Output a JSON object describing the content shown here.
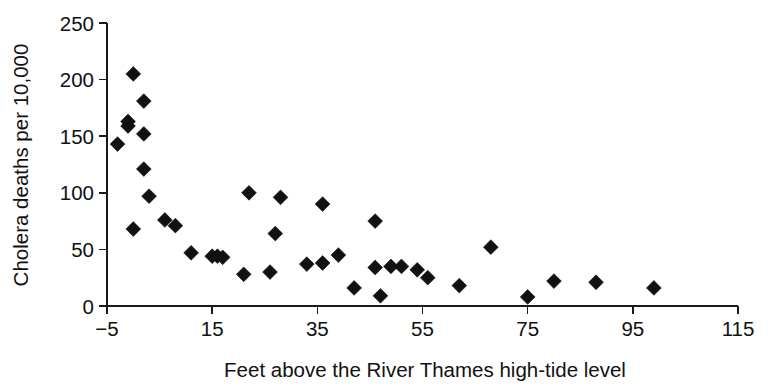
{
  "chart_data": {
    "type": "scatter",
    "title": "",
    "subtitle": "",
    "xlabel": "Feet above the River Thames high-tide level",
    "ylabel": "Cholera deaths per 10,000",
    "xlim": [
      -5,
      115
    ],
    "ylim": [
      0,
      250
    ],
    "xticks": [
      -5,
      15,
      35,
      55,
      75,
      95,
      115
    ],
    "xtick_labels": [
      "−5",
      "15",
      "35",
      "55",
      "75",
      "95",
      "115"
    ],
    "yticks": [
      0,
      50,
      100,
      150,
      200,
      250
    ],
    "ytick_labels": [
      "0",
      "50",
      "100",
      "150",
      "200",
      "250"
    ],
    "grid": false,
    "legend": null,
    "legend_position": "none",
    "marker": "diamond",
    "marker_color": "#111111",
    "series": [
      {
        "name": "Districts",
        "points": [
          {
            "x": 0,
            "y": 205
          },
          {
            "x": 2,
            "y": 181
          },
          {
            "x": -1,
            "y": 163
          },
          {
            "x": -1,
            "y": 159
          },
          {
            "x": 2,
            "y": 152
          },
          {
            "x": -3,
            "y": 143
          },
          {
            "x": 2,
            "y": 121
          },
          {
            "x": 3,
            "y": 97
          },
          {
            "x": 0,
            "y": 68
          },
          {
            "x": 6,
            "y": 76
          },
          {
            "x": 8,
            "y": 71
          },
          {
            "x": 11,
            "y": 47
          },
          {
            "x": 15,
            "y": 44
          },
          {
            "x": 16,
            "y": 44
          },
          {
            "x": 17,
            "y": 43
          },
          {
            "x": 21,
            "y": 28
          },
          {
            "x": 22,
            "y": 100
          },
          {
            "x": 28,
            "y": 96
          },
          {
            "x": 27,
            "y": 64
          },
          {
            "x": 26,
            "y": 30
          },
          {
            "x": 33,
            "y": 37
          },
          {
            "x": 36,
            "y": 90
          },
          {
            "x": 36,
            "y": 38
          },
          {
            "x": 39,
            "y": 45
          },
          {
            "x": 42,
            "y": 16
          },
          {
            "x": 46,
            "y": 75
          },
          {
            "x": 46,
            "y": 34
          },
          {
            "x": 47,
            "y": 9
          },
          {
            "x": 49,
            "y": 35
          },
          {
            "x": 51,
            "y": 35
          },
          {
            "x": 54,
            "y": 32
          },
          {
            "x": 56,
            "y": 25
          },
          {
            "x": 62,
            "y": 18
          },
          {
            "x": 68,
            "y": 52
          },
          {
            "x": 75,
            "y": 8
          },
          {
            "x": 80,
            "y": 22
          },
          {
            "x": 88,
            "y": 21
          },
          {
            "x": 99,
            "y": 16
          }
        ]
      }
    ]
  }
}
